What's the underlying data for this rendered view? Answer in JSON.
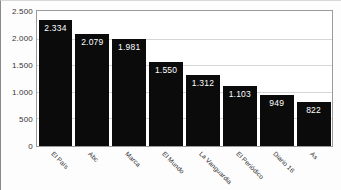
{
  "chart_data": {
    "type": "bar",
    "title": "",
    "subtitle": "",
    "xlabel": "",
    "ylabel": "",
    "categories": [
      "El País",
      "Abc",
      "Marca",
      "El Mundo",
      "La Vanguardia",
      "El Periódico",
      "Diario 16",
      "As"
    ],
    "values": [
      2334,
      2079,
      1981,
      1550,
      1312,
      1103,
      949,
      822
    ],
    "value_labels": [
      "2.334",
      "2.079",
      "1.981",
      "1.550",
      "1.312",
      "1.103",
      "949",
      "822"
    ],
    "ylim": [
      0,
      2500
    ],
    "ytick_values": [
      0,
      500,
      1000,
      1500,
      2000,
      2500
    ],
    "ytick_labels": [
      "0",
      "500",
      "1.000",
      "1.500",
      "2.000",
      "2.500"
    ],
    "grid": true,
    "grid_axis": "y",
    "legend": false,
    "legend_position": "none",
    "bar_color": "#0b0b0b",
    "value_label_color": "#ffffff",
    "plot_background": "#ffffff",
    "figure_background": "#fdfdfd",
    "grid_color": "#d6d6d6",
    "axis_color": "#9a9a9a",
    "tick_label_color": "#343434",
    "category_label_rotation": 45
  }
}
